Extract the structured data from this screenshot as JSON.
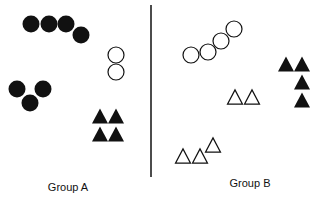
{
  "colors": {
    "ink": "#111111",
    "background": "#ffffff"
  },
  "divider": {
    "x": 151,
    "y1": 5,
    "y2": 177
  },
  "groups": [
    {
      "label": "Group A",
      "label_pos": {
        "x": 68,
        "y": 181
      },
      "filled_circles": [
        {
          "cx": 31,
          "cy": 24
        },
        {
          "cx": 49,
          "cy": 24
        },
        {
          "cx": 66,
          "cy": 24
        },
        {
          "cx": 81,
          "cy": 35
        },
        {
          "cx": 17,
          "cy": 89
        },
        {
          "cx": 43,
          "cy": 89
        },
        {
          "cx": 30,
          "cy": 103
        }
      ],
      "open_circles": [
        {
          "cx": 116,
          "cy": 55
        },
        {
          "cx": 116,
          "cy": 72
        }
      ],
      "filled_triangles": [
        {
          "cx": 100,
          "cy": 116
        },
        {
          "cx": 116,
          "cy": 116
        },
        {
          "cx": 100,
          "cy": 134
        },
        {
          "cx": 116,
          "cy": 134
        }
      ],
      "open_triangles": []
    },
    {
      "label": "Group B",
      "label_pos": {
        "x": 250,
        "y": 177
      },
      "filled_circles": [],
      "open_circles": [
        {
          "cx": 191,
          "cy": 55
        },
        {
          "cx": 208,
          "cy": 52
        },
        {
          "cx": 221,
          "cy": 41
        },
        {
          "cx": 234,
          "cy": 29
        }
      ],
      "filled_triangles": [
        {
          "cx": 286,
          "cy": 64
        },
        {
          "cx": 302,
          "cy": 64
        },
        {
          "cx": 302,
          "cy": 82
        },
        {
          "cx": 302,
          "cy": 100
        }
      ],
      "open_triangles": [
        {
          "cx": 235,
          "cy": 97
        },
        {
          "cx": 252,
          "cy": 97
        },
        {
          "cx": 183,
          "cy": 156
        },
        {
          "cx": 200,
          "cy": 156
        },
        {
          "cx": 213,
          "cy": 145
        }
      ]
    }
  ]
}
